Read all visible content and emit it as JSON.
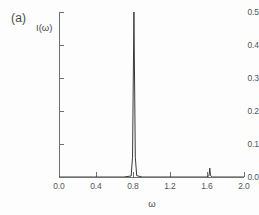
{
  "figure": {
    "panel_label": "(a)",
    "background_color": "#fdfdfd",
    "axis_color": "#6f6f6f",
    "curve_color": "#3a3a3a"
  },
  "chart_data": {
    "type": "line",
    "title": "",
    "subtitle": "",
    "panel": "(a)",
    "xlabel": "ω",
    "ylabel": "I(ω)",
    "xlim": [
      0.0,
      2.0
    ],
    "ylim": [
      0.0,
      0.5
    ],
    "xticks": [
      0.0,
      0.4,
      0.8,
      1.2,
      1.6,
      2.0
    ],
    "yticks": [
      0.0,
      0.1,
      0.2,
      0.3,
      0.4,
      0.5
    ],
    "xtick_labels": [
      "0.0",
      "0.4",
      "0.8",
      "1.2",
      "1.6",
      "2.0"
    ],
    "ytick_labels": [
      "0.0",
      "0.1",
      "0.2",
      "0.3",
      "0.4",
      "0.5"
    ],
    "grid": false,
    "legend": null,
    "annotations": [],
    "series": [
      {
        "name": "spectrum",
        "description": "Baseline near zero with one dominant sharp resonance and one weak satellite peak.",
        "peaks": [
          {
            "name": "main-peak",
            "x": 0.81,
            "height": 0.5,
            "halfwidth": 0.012,
            "base_halfwidth": 0.03
          },
          {
            "name": "satellite-peak",
            "x": 1.63,
            "height": 0.027,
            "halfwidth": 0.008,
            "base_halfwidth": 0.016
          }
        ],
        "baseline": 0.0,
        "x": [
          0.0,
          0.4,
          0.7,
          0.78,
          0.795,
          0.81,
          0.825,
          0.84,
          0.9,
          1.2,
          1.6,
          1.622,
          1.63,
          1.638,
          1.66,
          1.8,
          2.0
        ],
        "y": [
          0.0,
          0.0,
          0.0,
          0.003,
          0.06,
          0.5,
          0.06,
          0.004,
          0.0,
          0.0,
          0.0,
          0.004,
          0.027,
          0.004,
          0.0,
          0.0,
          0.0
        ]
      }
    ]
  }
}
